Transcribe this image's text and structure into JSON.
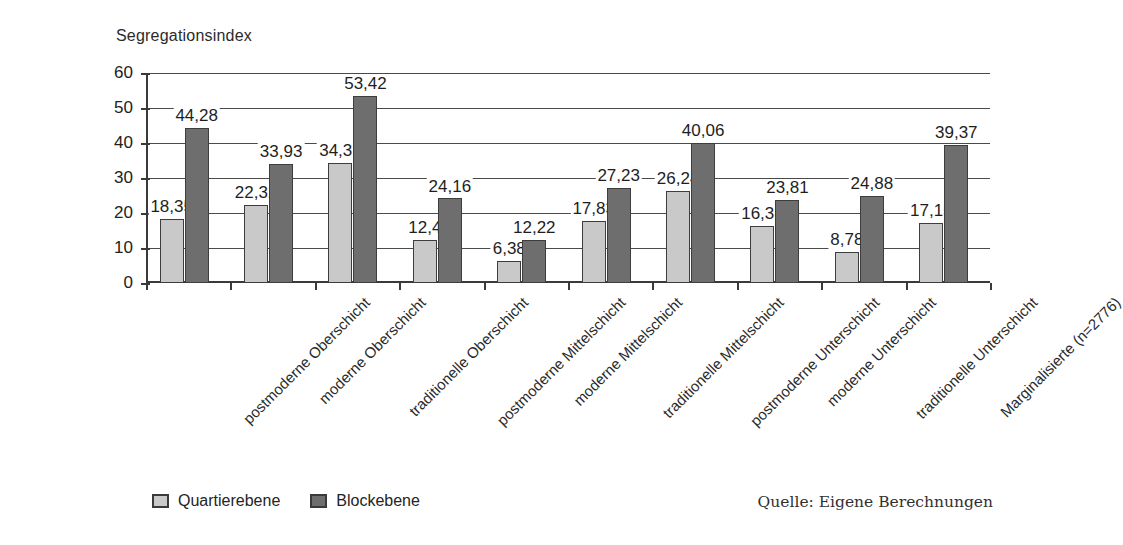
{
  "chart_data": {
    "type": "bar",
    "title": "",
    "ylabel": "Segregationsindex",
    "xlabel": "",
    "ylim": [
      0,
      60
    ],
    "yticks": [
      0,
      10,
      20,
      30,
      40,
      50,
      60
    ],
    "grid": true,
    "legend_position": "bottom-left",
    "categories": [
      "postmoderne Oberschicht",
      "moderne Oberschicht",
      "traditionelle Oberschicht",
      "postmoderne Mittelschicht",
      "moderne Mittelschicht",
      "traditionelle Mittelschicht",
      "postmoderne Unterschicht",
      "moderne Unterschicht",
      "traditionelle Unterschicht",
      "Marginalisierte (n=2776)"
    ],
    "series": [
      {
        "name": "Quartierebene",
        "color": "#c9c9c9",
        "values": [
          18.35,
          22.32,
          34.31,
          12.4,
          6.38,
          17.83,
          26.24,
          16.38,
          8.78,
          17.15
        ],
        "labels": [
          "18,35",
          "22,32",
          "34,31",
          "12,4",
          "6,38",
          "17,83",
          "26,24",
          "16,38",
          "8,78",
          "17,15"
        ]
      },
      {
        "name": "Blockebene",
        "color": "#6e6e6e",
        "values": [
          44.28,
          33.93,
          53.42,
          24.16,
          12.22,
          27.23,
          40.06,
          23.81,
          24.88,
          39.37
        ],
        "labels": [
          "44,28",
          "33,93",
          "53,42",
          "24,16",
          "12,22",
          "27,23",
          "40,06",
          "23,81",
          "24,88",
          "39,37"
        ]
      }
    ],
    "annotation": "Quelle: Eigene Berechnungen"
  },
  "legend": {
    "items": [
      {
        "label": "Quartierebene",
        "color": "#c9c9c9"
      },
      {
        "label": "Blockebene",
        "color": "#6e6e6e"
      }
    ]
  },
  "source_note": "Quelle: Eigene Berechnungen"
}
